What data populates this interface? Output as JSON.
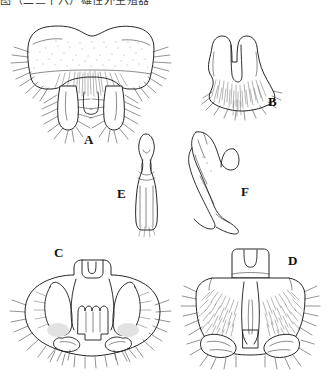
{
  "figure": {
    "type": "scientific-line-illustration",
    "background_color": "#ffffff",
    "ink_color": "#1a1a1a",
    "caption_top_cut": "图（二三十六）雄性外生殖器",
    "panels": [
      {
        "id": "A",
        "label": "A",
        "label_x": 88,
        "label_y": 144,
        "view": "pygofer, ventral view",
        "features": "broad bilobed plate, fine stippling on upper surface, dense setae fringe, two descending lobes with small median projection"
      },
      {
        "id": "B",
        "label": "B",
        "label_x": 272,
        "label_y": 106,
        "view": "subgenital plate, ventral view",
        "features": "shield-shaped with deep median U-notch, dense marginal setae along lower edge"
      },
      {
        "id": "C",
        "label": "C",
        "label_x": 58,
        "label_y": 257,
        "view": "genital capsule, ventral view",
        "features": "paired elongate lateral lobes, central crenulate plate, shaded basal patches, setose margins"
      },
      {
        "id": "D",
        "label": "D",
        "label_x": 292,
        "label_y": 265,
        "view": "genital capsule, dorsal view",
        "features": "broadly rounded, densely setose lateral areas, small median apical process, paired ventral lobes"
      },
      {
        "id": "E",
        "label": "E",
        "label_x": 122,
        "label_y": 198,
        "view": "aedeagus, ventral view",
        "features": "narrow elongate shaft with bulbous apex and median constriction"
      },
      {
        "id": "F",
        "label": "F",
        "label_x": 245,
        "label_y": 196,
        "view": "aedeagus, lateral view",
        "features": "strongly curved hook-shaped shaft with recurved subapical process"
      }
    ]
  }
}
